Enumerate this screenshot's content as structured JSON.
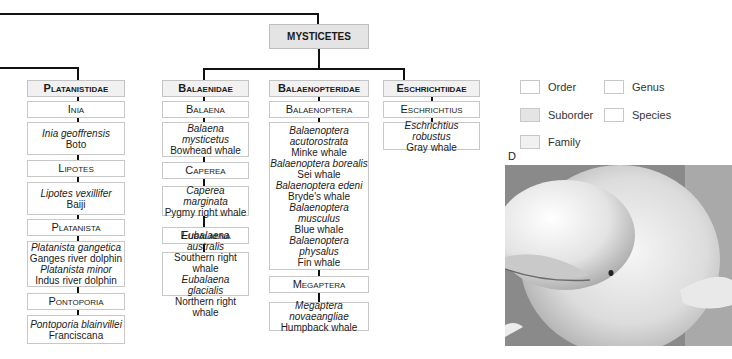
{
  "suborder": {
    "label": "MYSTICETES"
  },
  "families": [
    {
      "name": "Platanistidae",
      "groups": [
        {
          "genus": "Inia",
          "species": [
            {
              "sci": "Inia geoffrensis",
              "common": "Boto"
            }
          ]
        },
        {
          "genus": "Lipotes",
          "species": [
            {
              "sci": "Lipotes vexillifer",
              "common": "Baiji"
            }
          ]
        },
        {
          "genus": "Platanista",
          "species": [
            {
              "sci": "Platanista gangetica",
              "common": "Ganges river dolphin"
            },
            {
              "sci": "Platanista minor",
              "common": "Indus river dolphin"
            }
          ]
        },
        {
          "genus": "Pontoporia",
          "species": [
            {
              "sci": "Pontoporia blainvillei",
              "common": "Franciscana"
            }
          ]
        }
      ]
    },
    {
      "name": "Balaenidae",
      "groups": [
        {
          "genus": "Balaena",
          "species": [
            {
              "sci": "Balaena mysticetus",
              "common": "Bowhead whale"
            }
          ]
        },
        {
          "genus": "Caperea",
          "species": [
            {
              "sci": "Caperea marginata",
              "common": "Pygmy right whale"
            }
          ]
        },
        {
          "genus": "Eubalaena",
          "species": [
            {
              "sci": "Eubalaena australis",
              "common": "Southern right whale"
            },
            {
              "sci": "Eubalaena glacialis",
              "common": "Northern right whale"
            }
          ]
        }
      ]
    },
    {
      "name": "Balaenopteridae",
      "groups": [
        {
          "genus": "Balaenoptera",
          "species": [
            {
              "sci": "Balaenoptera acutorostrata",
              "common": "Minke whale"
            },
            {
              "sci": "Balaenoptera borealis",
              "common": "Sei whale"
            },
            {
              "sci": "Balaenoptera edeni",
              "common": "Bryde's whale"
            },
            {
              "sci": "Balaenoptera musculus",
              "common": "Blue whale"
            },
            {
              "sci": "Balaenoptera physalus",
              "common": "Fin whale"
            }
          ]
        },
        {
          "genus": "Megaptera",
          "species": [
            {
              "sci": "Megaptera novaeangliae",
              "common": "Humpback whale"
            }
          ]
        }
      ]
    },
    {
      "name": "Eschrichtiidae",
      "groups": [
        {
          "genus": "Eschrichtius",
          "species": [
            {
              "sci": "Eschrichtius robustus",
              "common": "Gray whale"
            }
          ]
        }
      ]
    }
  ],
  "legend": [
    {
      "label": "Order",
      "color": "#ffffff"
    },
    {
      "label": "Suborder",
      "color": "#e4e4e4"
    },
    {
      "label": "Family",
      "color": "#f1f1f1"
    },
    {
      "label": "Genus",
      "color": "#ffffff"
    },
    {
      "label": "Species",
      "color": "#ffffff"
    }
  ],
  "photo": {
    "label": "D",
    "subject": "beluga-whale-photo"
  }
}
